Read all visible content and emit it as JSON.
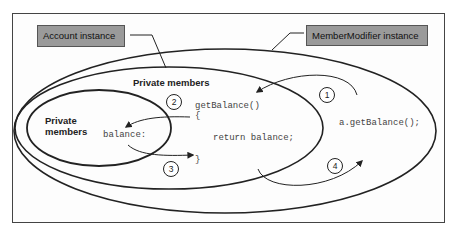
{
  "labels": {
    "account_instance": "Account instance",
    "membermodifier_instance": "MemberModifier instance",
    "outer_private_members": "Private members",
    "inner_private_members_line1": "Private",
    "inner_private_members_line2": "members"
  },
  "code": {
    "method_signature": "getBalance()",
    "open_brace": "{",
    "return_statement": "return balance;",
    "close_brace": "}",
    "field": "balance:",
    "call": "a.getBalance();"
  },
  "steps": [
    {
      "number": "1"
    },
    {
      "number": "2"
    },
    {
      "number": "3"
    },
    {
      "number": "4"
    }
  ],
  "colors": {
    "label_fill": "#9a9a9a",
    "stroke": "#222222",
    "code_text": "#444444"
  }
}
